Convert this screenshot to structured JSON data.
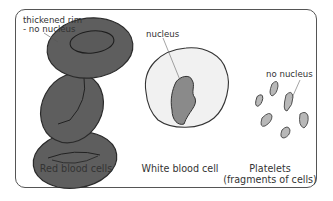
{
  "diagram": {
    "annotations": {
      "rbc_rim_line1": "thickened rim",
      "rbc_rim_line2": "- no nucleus",
      "wbc_nucleus": "nucleus",
      "platelet_nucleus": "no nucleus"
    },
    "captions": {
      "red_blood_cells": "Red blood cells",
      "white_blood_cell": "White blood cell",
      "platelets_line1": "Platelets",
      "platelets_line2": "(fragments of cells)"
    },
    "colors": {
      "rbc_fill": "#5e5e5e",
      "rbc_outline": "#2a2a2a",
      "wbc_fill": "#f1f1f1",
      "nucleus_fill": "#8a8a8a",
      "platelet_fill": "#b8b8b8",
      "frame": "#555555"
    }
  }
}
